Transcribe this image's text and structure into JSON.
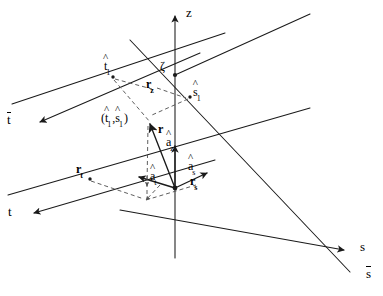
{
  "figure": {
    "width": 383,
    "height": 296,
    "stroke_color": "#1a1a1a",
    "dash_color": "#555555",
    "background": "#ffffff"
  },
  "axes": [
    {
      "id": "z",
      "label": "z",
      "accent": "none",
      "direction": "up",
      "tip": [
        175,
        12
      ]
    },
    {
      "id": "t-bar",
      "label": "t",
      "accent": "bar",
      "direction": "down-left",
      "tip": [
        36,
        124
      ]
    },
    {
      "id": "t",
      "label": "t",
      "accent": "none",
      "direction": "down-left",
      "tip": [
        30,
        215
      ]
    },
    {
      "id": "s",
      "label": "s",
      "accent": "none",
      "direction": "down-right",
      "tip": [
        348,
        252
      ]
    },
    {
      "id": "s-bar",
      "label": "s",
      "accent": "bar",
      "direction": "down-right",
      "tip": [
        356,
        278
      ]
    }
  ],
  "points": [
    {
      "id": "zeta",
      "label": "ζ",
      "x": 175,
      "y": 75,
      "note": "upper intersection on z axis"
    },
    {
      "id": "origin",
      "label": "",
      "x": 175,
      "y": 188,
      "note": "origin / vector tail"
    },
    {
      "id": "r-tip",
      "label": "",
      "x": 157,
      "y": 131,
      "note": "tip of position vector r"
    }
  ],
  "labels": {
    "z_axis": {
      "text": "z",
      "accent": "none",
      "x": 186,
      "y": 14
    },
    "zeta": {
      "text": "ζ",
      "accent": "none",
      "x": 161,
      "y": 64
    },
    "t_bar_axis": {
      "text": "t",
      "accent": "bar",
      "x": 7,
      "y": 118
    },
    "t_axis": {
      "text": "t",
      "accent": "none",
      "x": 7,
      "y": 211
    },
    "s_axis": {
      "text": "s",
      "accent": "none",
      "x": 358,
      "y": 245
    },
    "s_bar_axis": {
      "text": "s",
      "accent": "bar",
      "x": 366,
      "y": 270
    },
    "t_hat_1": {
      "text": "t",
      "accent": "hat",
      "sub": "1",
      "x": 104,
      "y": 65
    },
    "s_hat_1": {
      "text": "s",
      "accent": "hat",
      "sub": "1",
      "x": 191,
      "y": 91
    },
    "r_z": {
      "text": "r",
      "accent": "none",
      "sub": "z",
      "x": 150,
      "y": 83,
      "bold": true
    },
    "r_t": {
      "text": "r",
      "accent": "none",
      "sub": "t",
      "x": 80,
      "y": 168,
      "bold": true
    },
    "r_s": {
      "text": "r",
      "accent": "none",
      "sub": "s",
      "x": 187,
      "y": 180,
      "bold": true
    },
    "r_vec": {
      "text": "r",
      "accent": "none",
      "x": 157,
      "y": 128,
      "bold": true
    },
    "a_hat_z": {
      "text": "a",
      "accent": "hat",
      "sub": "z",
      "x": 166,
      "y": 140
    },
    "a_hat_s": {
      "text": "a",
      "accent": "hat",
      "sub": "s",
      "x": 186,
      "y": 163
    },
    "a_hat_t": {
      "text": "a",
      "accent": "hat",
      "sub": "t",
      "x": 148,
      "y": 173
    },
    "pair": {
      "open": "(",
      "first": "t",
      "first_sub": "1",
      "sep": ",",
      "second": "s",
      "second_sub": "1",
      "close": ")",
      "x": 104,
      "y": 117
    }
  },
  "construction": {
    "dashed_segments_note": "projection parallelograms linking r to its r_z, r_t, r_s components",
    "count": 9
  }
}
